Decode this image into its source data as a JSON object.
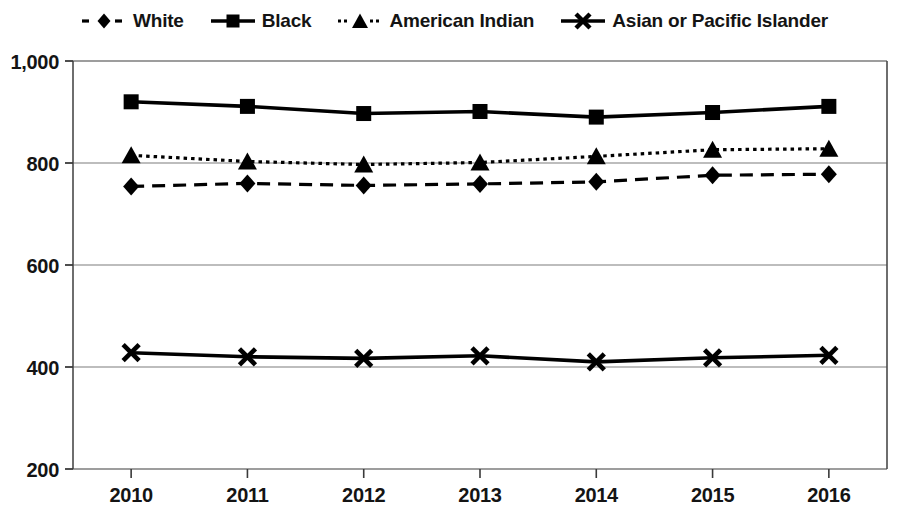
{
  "chart_data": {
    "type": "line",
    "title": "",
    "subtitle": "",
    "xlabel": "",
    "ylabel": "",
    "categories": [
      "2010",
      "2011",
      "2012",
      "2013",
      "2014",
      "2015",
      "2016"
    ],
    "x": [
      2010,
      2011,
      2012,
      2013,
      2014,
      2015,
      2016
    ],
    "ylim": [
      200,
      1000
    ],
    "yticks": [
      200,
      400,
      600,
      800,
      1000
    ],
    "ytick_labels": [
      "200",
      "400",
      "600",
      "800",
      "1,000"
    ],
    "grid": true,
    "grid_axis": "y",
    "legend_position": "top",
    "series": [
      {
        "name": "White",
        "marker": "diamond",
        "line_style": "dashed",
        "color": "#000000",
        "values": [
          754,
          760,
          756,
          759,
          763,
          776,
          778
        ]
      },
      {
        "name": "Black",
        "marker": "square",
        "line_style": "solid",
        "color": "#000000",
        "values": [
          920,
          911,
          897,
          901,
          890,
          899,
          911
        ]
      },
      {
        "name": "American Indian",
        "marker": "triangle",
        "line_style": "dotted",
        "color": "#000000",
        "values": [
          815,
          803,
          797,
          801,
          813,
          826,
          828
        ]
      },
      {
        "name": "Asian or Pacific Islander",
        "marker": "cross",
        "line_style": "solid",
        "color": "#000000",
        "values": [
          428,
          420,
          417,
          422,
          410,
          418,
          423
        ]
      }
    ]
  },
  "legend": {
    "items": [
      {
        "label": "White",
        "key": "dashed-diamond-key"
      },
      {
        "label": "Black",
        "key": "solid-square-key"
      },
      {
        "label": "American Indian",
        "key": "dotted-triangle-key"
      },
      {
        "label": "Asian or Pacific Islander",
        "key": "solid-cross-key"
      }
    ]
  },
  "axes": {
    "y_tick_labels": [
      "1,000",
      "800",
      "600",
      "400",
      "200"
    ],
    "x_tick_labels": [
      "2010",
      "2011",
      "2012",
      "2013",
      "2014",
      "2015",
      "2016"
    ]
  }
}
